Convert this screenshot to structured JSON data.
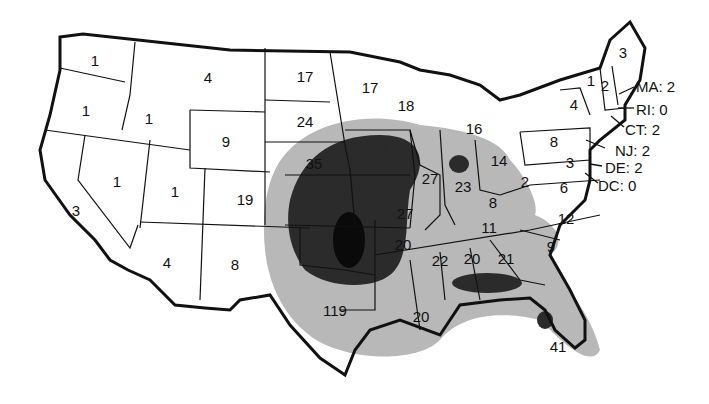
{
  "map": {
    "type": "choropleth-counts",
    "region": "Contiguous United States",
    "shading_levels": [
      "white",
      "light-gray",
      "dark-gray",
      "black"
    ],
    "colors": {
      "background": "#ffffff",
      "light": "#b8b8b8",
      "dark": "#2b2b2b",
      "darkest": "#0a0a0a",
      "border": "#111111"
    },
    "states": [
      {
        "abbr": "WA",
        "value": "1"
      },
      {
        "abbr": "OR",
        "value": "1"
      },
      {
        "abbr": "CA",
        "value": "3"
      },
      {
        "abbr": "NV",
        "value": "1"
      },
      {
        "abbr": "ID",
        "value": "1"
      },
      {
        "abbr": "MT",
        "value": "4"
      },
      {
        "abbr": "WY",
        "value": "9"
      },
      {
        "abbr": "UT",
        "value": "1"
      },
      {
        "abbr": "CO",
        "value": "19"
      },
      {
        "abbr": "AZ",
        "value": "4"
      },
      {
        "abbr": "NM",
        "value": "8"
      },
      {
        "abbr": "ND",
        "value": "17"
      },
      {
        "abbr": "SD",
        "value": "24"
      },
      {
        "abbr": "NE",
        "value": "35"
      },
      {
        "abbr": "KS",
        "value": "41"
      },
      {
        "abbr": "OK",
        "value": ""
      },
      {
        "abbr": "TX",
        "value": "119"
      },
      {
        "abbr": "MN",
        "value": "17"
      },
      {
        "abbr": "IA",
        "value": "27"
      },
      {
        "abbr": "MO",
        "value": "27"
      },
      {
        "abbr": "AR",
        "value": "20"
      },
      {
        "abbr": "LA",
        "value": "20"
      },
      {
        "abbr": "WI",
        "value": "18"
      },
      {
        "abbr": "IL",
        "value": "27"
      },
      {
        "abbr": "MI",
        "value": "16"
      },
      {
        "abbr": "IN",
        "value": "23"
      },
      {
        "abbr": "OH",
        "value": "14"
      },
      {
        "abbr": "KY",
        "value": "8"
      },
      {
        "abbr": "TN",
        "value": "11"
      },
      {
        "abbr": "MS",
        "value": "22"
      },
      {
        "abbr": "AL",
        "value": "20"
      },
      {
        "abbr": "GA",
        "value": "21"
      },
      {
        "abbr": "FL",
        "value": "41"
      },
      {
        "abbr": "SC",
        "value": "9"
      },
      {
        "abbr": "NC",
        "value": "12"
      },
      {
        "abbr": "VA",
        "value": "6"
      },
      {
        "abbr": "WV",
        "value": "2"
      },
      {
        "abbr": "MD",
        "value": "3"
      },
      {
        "abbr": "PA",
        "value": "8"
      },
      {
        "abbr": "NY",
        "value": "4"
      },
      {
        "abbr": "VT",
        "value": "1"
      },
      {
        "abbr": "NH",
        "value": "2"
      },
      {
        "abbr": "ME",
        "value": "3"
      }
    ],
    "callouts": [
      {
        "text": "MA: 2"
      },
      {
        "text": "RI: 0"
      },
      {
        "text": "CT: 2"
      },
      {
        "text": "NJ: 2"
      },
      {
        "text": "DE: 2"
      },
      {
        "text": "DC: 0"
      }
    ]
  }
}
